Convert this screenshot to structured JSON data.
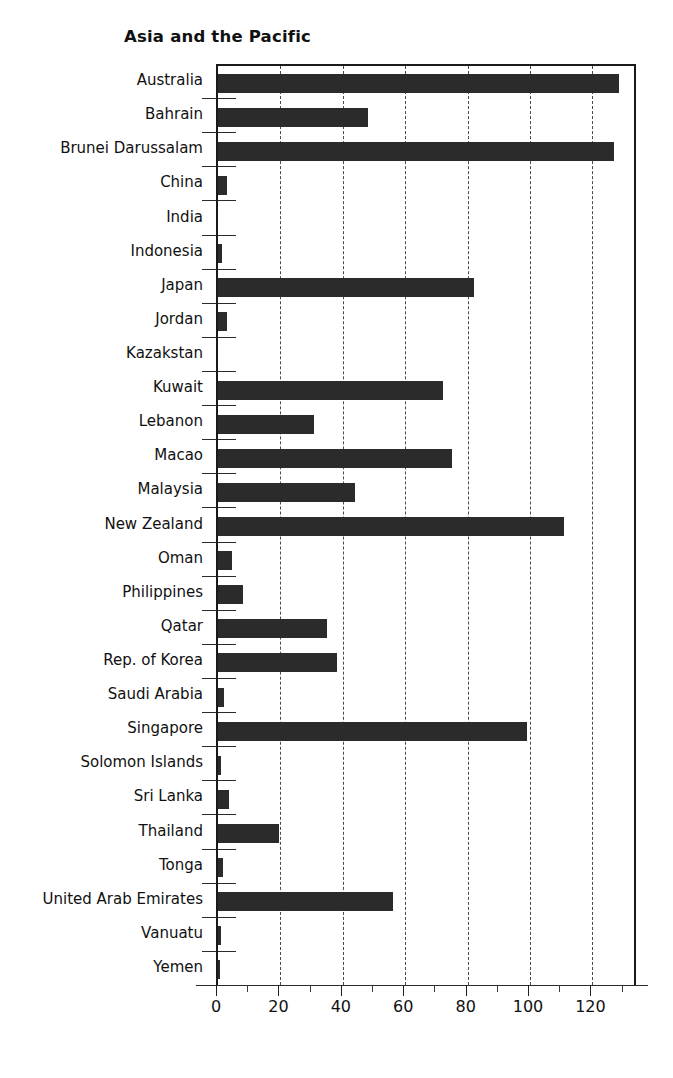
{
  "chart_data": {
    "type": "bar",
    "orientation": "horizontal",
    "title": "Asia and the Pacific",
    "xlabel": "",
    "ylabel": "",
    "xlim": [
      0,
      134.6
    ],
    "xticks": [
      0,
      20,
      40,
      60,
      80,
      100,
      120
    ],
    "xtick_labels": [
      "0",
      "20",
      "40",
      "60",
      "80",
      "100",
      "120"
    ],
    "minor_tick_step": 10,
    "grid": "vertical dashed gridlines at 20,40,60,80,100,120",
    "legend": "none",
    "bar_color": "#2b2b2b",
    "categories": [
      "Australia",
      "Bahrain",
      "Brunei Darussalam",
      "China",
      "India",
      "Indonesia",
      "Japan",
      "Jordan",
      "Kazakstan",
      "Kuwait",
      "Lebanon",
      "Macao",
      "Malaysia",
      "New Zealand",
      "Oman",
      "Philippines",
      "Qatar",
      "Rep. of Korea",
      "Saudi Arabia",
      "Singapore",
      "Solomon Islands",
      "Sri Lanka",
      "Thailand",
      "Tonga",
      "United Arab Emirates",
      "Vanuatu",
      "Yemen"
    ],
    "values": [
      128.5,
      48.0,
      127.0,
      3.0,
      0.0,
      1.3,
      82.0,
      3.0,
      0.0,
      72.0,
      30.7,
      75.0,
      44.0,
      111.0,
      4.5,
      8.0,
      35.0,
      38.0,
      2.0,
      99.0,
      1.0,
      3.5,
      19.5,
      1.5,
      56.0,
      1.0,
      0.7
    ]
  }
}
